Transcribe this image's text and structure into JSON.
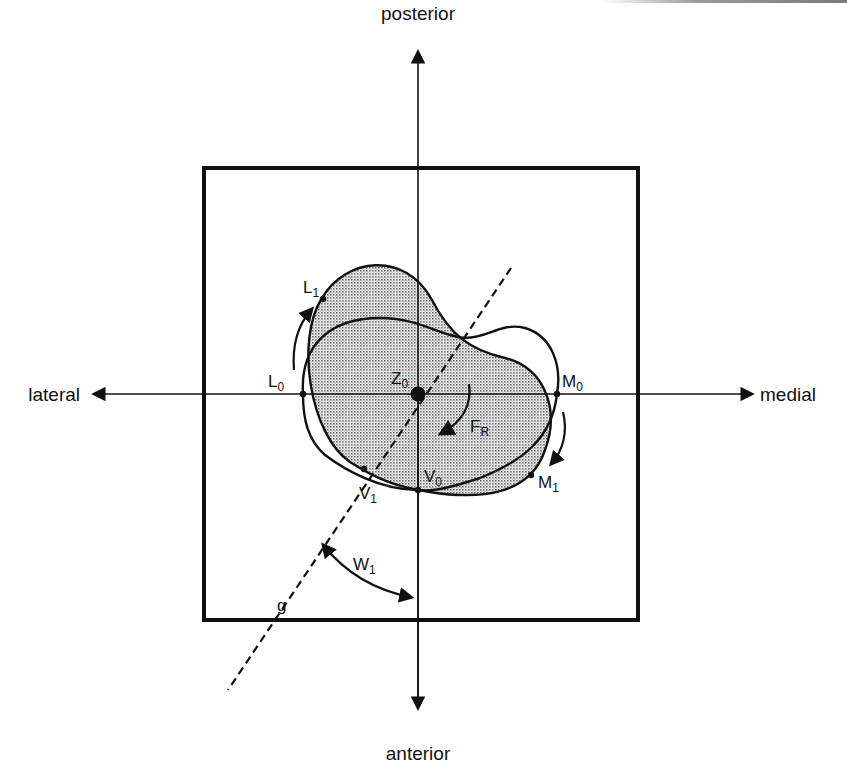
{
  "figure": {
    "type": "anatomical rotation diagram",
    "directions": {
      "top": "posterior",
      "bottom": "anterior",
      "left": "lateral",
      "right": "medial"
    },
    "points": {
      "L0": {
        "base": "L",
        "sub": "0"
      },
      "L1": {
        "base": "L",
        "sub": "1"
      },
      "M0": {
        "base": "M",
        "sub": "0"
      },
      "M1": {
        "base": "M",
        "sub": "1"
      },
      "V0": {
        "base": "V",
        "sub": "0"
      },
      "V1": {
        "base": "V",
        "sub": "1"
      },
      "Z0": {
        "base": "Z",
        "sub": "0"
      }
    },
    "force": {
      "base": "F",
      "sub": "R"
    },
    "angle": {
      "base": "W",
      "sub": "1"
    },
    "line": {
      "label": "g"
    },
    "colors": {
      "stroke": "#111111",
      "shade": "#bdbdbd",
      "background": "#ffffff"
    }
  }
}
